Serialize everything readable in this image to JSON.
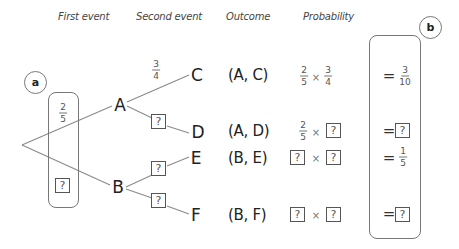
{
  "headers": {
    "first_event": "First event",
    "second_event": "Second event",
    "outcome": "Outcome",
    "probability": "Probability"
  },
  "labels": {
    "a": "a",
    "b": "b"
  },
  "tree": {
    "first_level": [
      {
        "node": "A",
        "probability": {
          "num": "2",
          "den": "5"
        }
      },
      {
        "node": "B",
        "probability": "?"
      }
    ],
    "second_level": [
      {
        "parent": "A",
        "node": "C",
        "probability": {
          "num": "3",
          "den": "4"
        }
      },
      {
        "parent": "A",
        "node": "D",
        "probability": "?"
      },
      {
        "parent": "B",
        "node": "E",
        "probability": "?"
      },
      {
        "parent": "B",
        "node": "F",
        "probability": "?"
      }
    ]
  },
  "rows": [
    {
      "outcome": "(A, C)",
      "factor1": {
        "num": "2",
        "den": "5"
      },
      "times": "×",
      "factor2": {
        "num": "3",
        "den": "4"
      },
      "equals": "=",
      "result": {
        "num": "3",
        "den": "10"
      }
    },
    {
      "outcome": "(A, D)",
      "factor1": {
        "num": "2",
        "den": "5"
      },
      "times": "×",
      "factor2": "?",
      "equals": "=",
      "result": "?"
    },
    {
      "outcome": "(B, E)",
      "factor1": "?",
      "times": "×",
      "factor2": "?",
      "equals": "=",
      "result": {
        "num": "1",
        "den": "5"
      }
    },
    {
      "outcome": "(B, F)",
      "factor1": "?",
      "times": "×",
      "factor2": "?",
      "equals": "=",
      "result": "?"
    }
  ],
  "placeholder": "?"
}
